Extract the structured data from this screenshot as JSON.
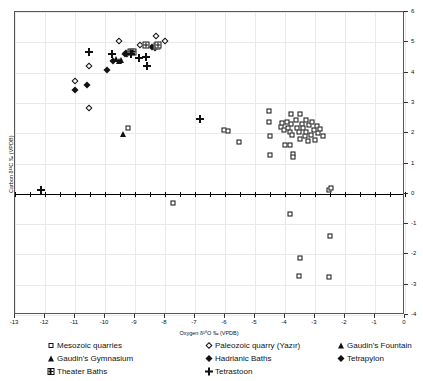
{
  "chart_data": {
    "type": "scatter",
    "title": "",
    "xlabel": "Oxygen δ¹⁸O ‰ (VPDB)",
    "ylabel": "Carbon δ¹³C ‰ (VPDB)",
    "xlim": [
      -13,
      0
    ],
    "ylim": [
      -4,
      6
    ],
    "xticks": [
      "-13",
      "-12",
      "-11",
      "-10",
      "-9",
      "-8",
      "-7",
      "-6",
      "-5",
      "-4",
      "-3",
      "-2",
      "-1",
      "0"
    ],
    "xtick_values": [
      -13,
      -12,
      -11,
      -10,
      -9,
      -8,
      -7,
      -6,
      -5,
      -4,
      -3,
      -2,
      -1,
      0
    ],
    "yticks": [
      "-4",
      "-3",
      "-2",
      "-1",
      "0",
      "1",
      "2",
      "3",
      "4",
      "5",
      "6"
    ],
    "ytick_values": [
      -4,
      -3,
      -2,
      -1,
      0,
      1,
      2,
      3,
      4,
      5,
      6
    ],
    "grid": true,
    "legend_position": "below",
    "series": [
      {
        "name": "Mesozoic quarries",
        "marker": "open-square",
        "points": [
          [
            -9.25,
            2.18
          ],
          [
            -6.05,
            2.12
          ],
          [
            -5.9,
            2.08
          ],
          [
            -5.55,
            1.72
          ],
          [
            -4.55,
            2.72
          ],
          [
            -4.55,
            2.38
          ],
          [
            -4.5,
            1.92
          ],
          [
            -4.5,
            1.28
          ],
          [
            -4.15,
            2.22
          ],
          [
            -4.1,
            2.35
          ],
          [
            -4.05,
            2.12
          ],
          [
            -4.0,
            1.6
          ],
          [
            -3.95,
            2.38
          ],
          [
            -3.9,
            2.18
          ],
          [
            -3.85,
            2.05
          ],
          [
            -3.85,
            1.62
          ],
          [
            -3.8,
            2.62
          ],
          [
            -3.8,
            2.3
          ],
          [
            -3.78,
            1.95
          ],
          [
            -3.75,
            1.3
          ],
          [
            -3.72,
            1.22
          ],
          [
            -3.65,
            2.45
          ],
          [
            -3.6,
            2.18
          ],
          [
            -3.55,
            2.05
          ],
          [
            -3.5,
            1.82
          ],
          [
            -3.5,
            2.62
          ],
          [
            -3.45,
            2.3
          ],
          [
            -3.4,
            2.18
          ],
          [
            -3.35,
            1.9
          ],
          [
            -3.3,
            2.42
          ],
          [
            -3.3,
            2.05
          ],
          [
            -3.25,
            1.75
          ],
          [
            -3.2,
            2.28
          ],
          [
            -3.15,
            1.95
          ],
          [
            -3.1,
            2.38
          ],
          [
            -3.05,
            2.12
          ],
          [
            -3.0,
            1.78
          ],
          [
            -2.95,
            2.25
          ],
          [
            -2.9,
            2.02
          ],
          [
            -2.85,
            2.15
          ],
          [
            -2.75,
            1.9
          ],
          [
            -2.55,
            0.12
          ],
          [
            -2.48,
            0.18
          ],
          [
            -7.75,
            -0.32
          ],
          [
            -3.85,
            -0.68
          ],
          [
            -2.5,
            -1.38
          ],
          [
            -3.5,
            -2.12
          ],
          [
            -3.55,
            -2.72
          ],
          [
            -2.55,
            -2.75
          ]
        ]
      },
      {
        "name": "Paleozoic quarry (Yazır)",
        "marker": "open-diamond",
        "points": [
          [
            -11.0,
            3.72
          ],
          [
            -10.55,
            4.22
          ],
          [
            -10.55,
            2.82
          ],
          [
            -9.55,
            5.05
          ],
          [
            -8.85,
            4.92
          ],
          [
            -8.3,
            5.22
          ],
          [
            -8.0,
            5.05
          ]
        ]
      },
      {
        "name": "Gaudin's Fountain",
        "marker": "filled-triangle",
        "points": [
          [
            -9.4,
            1.98
          ]
        ]
      },
      {
        "name": "Gaudin's Gymnasium",
        "marker": "filled-triangle",
        "points": [
          [
            -9.62,
            4.45
          ],
          [
            -9.55,
            4.38
          ],
          [
            -9.48,
            4.42
          ]
        ]
      },
      {
        "name": "Hadrianic Baths",
        "marker": "filled-diamond",
        "points": [
          [
            -11.0,
            3.42
          ],
          [
            -10.6,
            3.6
          ],
          [
            -9.95,
            4.08
          ],
          [
            -9.72,
            4.38
          ],
          [
            -9.35,
            4.62
          ],
          [
            -9.28,
            4.6
          ],
          [
            -8.42,
            4.85
          ],
          [
            -8.35,
            4.82
          ]
        ]
      },
      {
        "name": "Tetrapylon",
        "marker": "filled-diamond",
        "points": [
          [
            -9.3,
            4.65
          ]
        ]
      },
      {
        "name": "Theater Baths",
        "marker": "windowed-square",
        "points": [
          [
            -9.15,
            4.68
          ],
          [
            -9.08,
            4.68
          ],
          [
            -8.62,
            4.9
          ],
          [
            -8.28,
            4.88
          ],
          [
            -8.22,
            4.9
          ]
        ]
      },
      {
        "name": "Tetrastoon",
        "marker": "plus",
        "points": [
          [
            -12.12,
            0.12
          ],
          [
            -10.55,
            4.68
          ],
          [
            -9.78,
            4.62
          ],
          [
            -9.12,
            4.62
          ],
          [
            -8.88,
            4.48
          ],
          [
            -8.62,
            4.52
          ],
          [
            -8.6,
            4.22
          ],
          [
            -6.85,
            2.48
          ]
        ]
      }
    ]
  },
  "legend": {
    "columns": [
      {
        "items": [
          {
            "label": "Mesozoic quarries",
            "marker": "open-square"
          },
          {
            "label": "Gaudin's Gymnasium",
            "marker": "filled-triangle"
          },
          {
            "label": "Theater Baths",
            "marker": "windowed-square"
          }
        ]
      },
      {
        "items": [
          {
            "label": "Paleozoic quarry (Yazır)",
            "marker": "open-diamond"
          },
          {
            "label": "Hadrianic Baths",
            "marker": "filled-diamond"
          },
          {
            "label": "Tetrastoon",
            "marker": "plus"
          }
        ]
      },
      {
        "items": [
          {
            "label": "Gaudin's Fountain",
            "marker": "filled-triangle"
          },
          {
            "label": "Tetrapylon",
            "marker": "filled-diamond"
          }
        ]
      }
    ]
  }
}
